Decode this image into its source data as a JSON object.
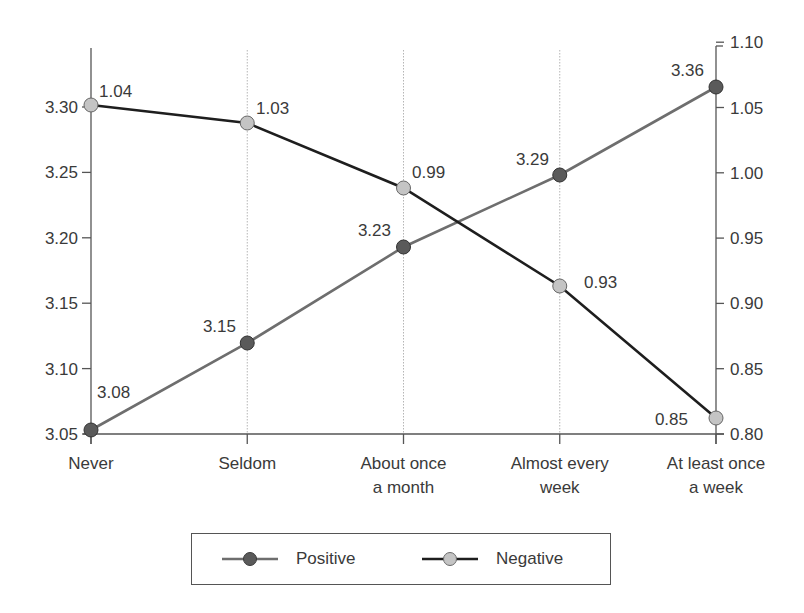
{
  "chart_data": {
    "type": "line",
    "title": "",
    "xlabel": "",
    "ylabel": "",
    "categories": [
      "Never",
      "Seldom",
      "About once a month",
      "Almost every week",
      "At least once a week"
    ],
    "category_lines": [
      [
        "Never"
      ],
      [
        "Seldom"
      ],
      [
        "About once",
        "a month"
      ],
      [
        "Almost every",
        "week"
      ],
      [
        "At least once",
        "a week"
      ]
    ],
    "left_axis": {
      "ylim": [
        3.05,
        3.35
      ],
      "ticks": [
        "3.05",
        "3.10",
        "3.15",
        "3.20",
        "3.25",
        "3.30"
      ],
      "series": "Positive"
    },
    "right_axis": {
      "ylim": [
        0.8,
        1.1
      ],
      "ticks": [
        "0.80",
        "0.85",
        "0.90",
        "0.95",
        "1.00",
        "1.05",
        "1.10"
      ],
      "series": "Negative"
    },
    "series": [
      {
        "name": "Positive",
        "axis": "left",
        "values": [
          3.08,
          3.15,
          3.23,
          3.29,
          3.36
        ],
        "labels": [
          "3.08",
          "3.15",
          "3.23",
          "3.29",
          "3.36"
        ],
        "marker_color": "#5a5a5a",
        "line_color": "#6e6e6e"
      },
      {
        "name": "Negative",
        "axis": "right",
        "values": [
          1.04,
          1.03,
          0.99,
          0.93,
          0.85
        ],
        "labels": [
          "1.04",
          "1.03",
          "0.99",
          "0.93",
          "0.85"
        ],
        "marker_color": "#c4c4c4",
        "line_color": "#1e1e1e"
      }
    ],
    "grid": "vertical dotted lines at categories",
    "legend_position": "bottom"
  },
  "legend": {
    "items": [
      {
        "label": "Positive"
      },
      {
        "label": "Negative"
      }
    ]
  }
}
